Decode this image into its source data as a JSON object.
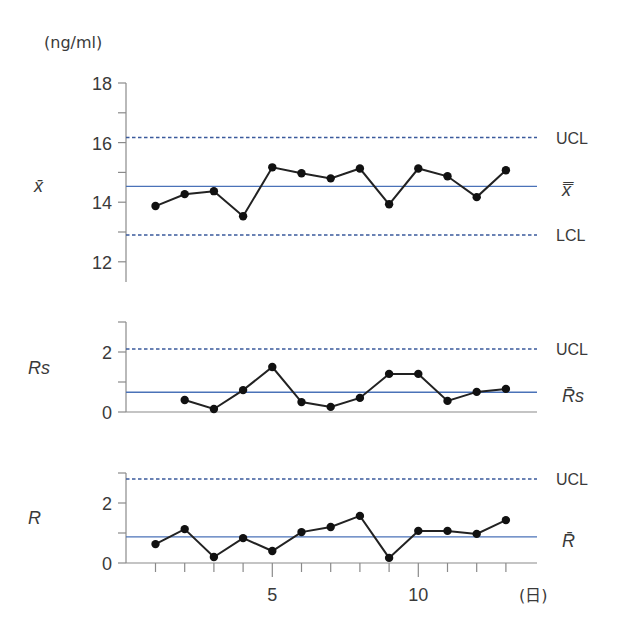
{
  "colors": {
    "center_line": "#4a72b8",
    "limit_line": "#3a5a9c",
    "data_line": "#222222",
    "axis": "#8a8a8a"
  },
  "labels": {
    "unit": "(ng/ml)",
    "x_unit": "(日)",
    "xbar_chart_label": "x̄",
    "rs_chart_label": "Rs",
    "r_chart_label": "R",
    "ucl": "UCL",
    "lcl": "LCL",
    "xbar_center": "x̿",
    "rs_center": "R̄s",
    "r_center": "R̄"
  },
  "chart_data": [
    {
      "type": "line",
      "title": "x̄ control chart",
      "ylabel": "x̄",
      "unit": "ng/ml",
      "x": [
        1,
        2,
        3,
        4,
        5,
        6,
        7,
        8,
        9,
        10,
        11,
        12,
        13
      ],
      "values": [
        13.87,
        14.27,
        14.37,
        13.53,
        15.17,
        14.97,
        14.8,
        15.13,
        13.93,
        15.13,
        14.87,
        14.17,
        15.07
      ],
      "yticks": [
        12,
        14,
        16,
        18
      ],
      "ylim": [
        11.4,
        18
      ],
      "ucl": 16.17,
      "center": 14.53,
      "lcl": 12.9,
      "line_labels": [
        "UCL",
        "x̿",
        "LCL"
      ]
    },
    {
      "type": "line",
      "title": "Rs control chart",
      "ylabel": "Rs",
      "x": [
        2,
        3,
        4,
        5,
        6,
        7,
        8,
        9,
        10,
        11,
        12,
        13
      ],
      "values": [
        0.4,
        0.1,
        0.73,
        1.5,
        0.33,
        0.17,
        0.47,
        1.27,
        1.27,
        0.37,
        0.67,
        0.77
      ],
      "yticks": [
        0,
        2
      ],
      "ylim": [
        0,
        3
      ],
      "ucl": 2.1,
      "center": 0.66,
      "line_labels": [
        "UCL",
        "R̄s"
      ]
    },
    {
      "type": "line",
      "title": "R control chart",
      "ylabel": "R",
      "xlabel": "(日)",
      "x": [
        1,
        2,
        3,
        4,
        5,
        6,
        7,
        8,
        9,
        10,
        11,
        12,
        13
      ],
      "values": [
        0.63,
        1.13,
        0.2,
        0.83,
        0.4,
        1.03,
        1.2,
        1.57,
        0.17,
        1.07,
        1.07,
        0.97,
        1.43
      ],
      "yticks": [
        0,
        2
      ],
      "xticks": [
        5,
        10
      ],
      "ylim": [
        0,
        3
      ],
      "ucl": 2.8,
      "center": 0.87,
      "line_labels": [
        "UCL",
        "R̄"
      ]
    }
  ]
}
